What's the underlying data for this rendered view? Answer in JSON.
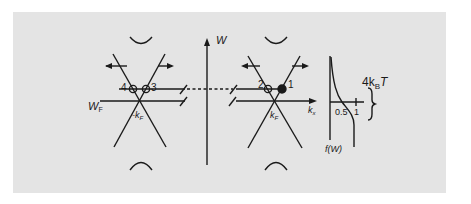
{
  "figure": {
    "background_color": "#e4e4e4",
    "line_color": "#1a1a1a",
    "labels": {
      "energy_axis": "W",
      "fermi_energy": "W",
      "fermi_energy_sub": "F",
      "neg_kf": "-k",
      "neg_kf_sub": "F",
      "kf": "k",
      "kf_sub": "F",
      "kx_axis": "k",
      "kx_axis_sub": "x",
      "point_1": "1",
      "point_2": "2",
      "point_3": "3",
      "point_4": "4",
      "tick_half": "0.5",
      "tick_one": "1",
      "fermi_function": "f(W)",
      "thermal_width_prefix": "4k",
      "thermal_width_sub": "B",
      "thermal_width_suffix": "T"
    },
    "points": [
      {
        "id": "1",
        "state": "filled"
      },
      {
        "id": "2",
        "state": "empty"
      },
      {
        "id": "3",
        "state": "empty"
      },
      {
        "id": "4",
        "state": "empty"
      }
    ]
  }
}
